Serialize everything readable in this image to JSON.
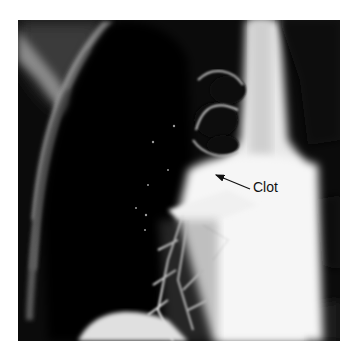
{
  "figure": {
    "type": "radiograph",
    "annotation": {
      "label": "Clot",
      "arrow": {
        "from": [
          250,
          189
        ],
        "to": [
          215,
          175
        ]
      }
    },
    "colors": {
      "background": "#ffffff",
      "dark_lung": "#0a0a0a",
      "bright_opacity": "#f4f4f4",
      "label_text": "#111111"
    }
  }
}
